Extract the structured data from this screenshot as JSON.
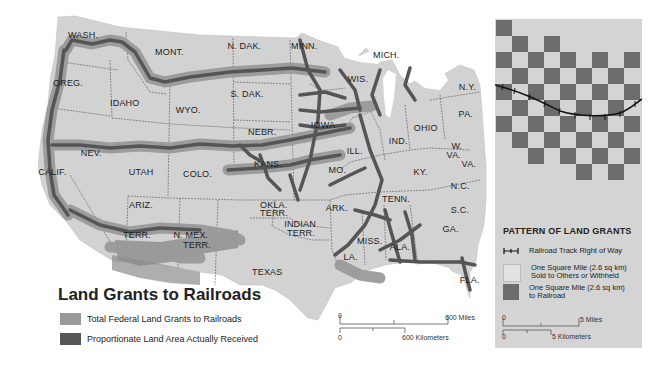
{
  "map": {
    "title": "Land Grants to Railroads",
    "colors": {
      "land": "#d2d2d2",
      "total_grant": "#9a9a9a",
      "received": "#5a5a5a",
      "border": "#555555",
      "water": "#ffffff"
    },
    "legend": [
      {
        "label": "Total Federal Land Grants to Railroads",
        "color": "#9a9a9a"
      },
      {
        "label": "Proportionate Land Area Actually Received",
        "color": "#555555"
      }
    ],
    "state_labels": [
      {
        "text": "WASH.",
        "x": 82,
        "y": 36
      },
      {
        "text": "MONT.",
        "x": 169,
        "y": 53
      },
      {
        "text": "N. DAK.",
        "x": 247,
        "y": 47
      },
      {
        "text": "MINN.",
        "x": 305,
        "y": 47
      },
      {
        "text": "MICH.",
        "x": 387,
        "y": 56
      },
      {
        "text": "OREG.",
        "x": 67,
        "y": 84
      },
      {
        "text": "IDAHO",
        "x": 124,
        "y": 104
      },
      {
        "text": "WYO.",
        "x": 187,
        "y": 111
      },
      {
        "text": "S. DAK.",
        "x": 250,
        "y": 95
      },
      {
        "text": "WIS.",
        "x": 359,
        "y": 80
      },
      {
        "text": "N.Y.",
        "x": 470,
        "y": 88
      },
      {
        "text": "PA.",
        "x": 467,
        "y": 115
      },
      {
        "text": "IOWA",
        "x": 322,
        "y": 126
      },
      {
        "text": "NEBR.",
        "x": 262,
        "y": 133
      },
      {
        "text": "OHIO",
        "x": 425,
        "y": 129
      },
      {
        "text": "NEV.",
        "x": 92,
        "y": 154
      },
      {
        "text": "IND.",
        "x": 400,
        "y": 142
      },
      {
        "text": "ILL.",
        "x": 358,
        "y": 152
      },
      {
        "text": "W.",
        "x": 457,
        "y": 147
      },
      {
        "text": "VA.",
        "x": 455,
        "y": 156
      },
      {
        "text": "UTAH",
        "x": 140,
        "y": 173
      },
      {
        "text": "COLO.",
        "x": 197,
        "y": 175
      },
      {
        "text": "KANS.",
        "x": 268,
        "y": 165
      },
      {
        "text": "MO.",
        "x": 337,
        "y": 171
      },
      {
        "text": "KY.",
        "x": 422,
        "y": 173
      },
      {
        "text": "VA.",
        "x": 470,
        "y": 165
      },
      {
        "text": "CALIF.",
        "x": 55,
        "y": 173
      },
      {
        "text": "N.C.",
        "x": 462,
        "y": 187
      },
      {
        "text": "ARIZ.",
        "x": 143,
        "y": 206
      },
      {
        "text": "TENN.",
        "x": 396,
        "y": 200
      },
      {
        "text": "OKLA.",
        "x": 274,
        "y": 206
      },
      {
        "text": "TERR.",
        "x": 274,
        "y": 214
      },
      {
        "text": "ARK.",
        "x": 337,
        "y": 209
      },
      {
        "text": "S.C.",
        "x": 462,
        "y": 211
      },
      {
        "text": "INDIAN",
        "x": 301,
        "y": 225
      },
      {
        "text": "TERR.",
        "x": 301,
        "y": 234
      },
      {
        "text": "TERR.",
        "x": 137,
        "y": 236
      },
      {
        "text": "N. MEX.",
        "x": 193,
        "y": 236
      },
      {
        "text": "TERR.",
        "x": 197,
        "y": 246
      },
      {
        "text": "GA.",
        "x": 451,
        "y": 230
      },
      {
        "text": "MISS.",
        "x": 371,
        "y": 242
      },
      {
        "text": "ALA.",
        "x": 401,
        "y": 248
      },
      {
        "text": "LA.",
        "x": 352,
        "y": 258
      },
      {
        "text": "TEXAS",
        "x": 266,
        "y": 273
      },
      {
        "text": "FLA.",
        "x": 471,
        "y": 281
      }
    ],
    "scale": {
      "miles_zero": "0",
      "miles_label": "600 Miles",
      "km_zero": "0",
      "km_label": "600 Kilometers"
    }
  },
  "panel": {
    "title": "PATTERN OF LAND GRANTS",
    "colors": {
      "light": "#d4d4d4",
      "dark": "#6c6c6c"
    },
    "grid": {
      "cols": 9,
      "rows": 10,
      "dark_cells": [
        [
          0
        ],
        [
          1,
          3
        ],
        [
          0,
          2,
          4,
          6,
          8
        ],
        [
          1,
          3,
          5,
          7
        ],
        [
          0,
          2,
          4,
          6,
          8
        ],
        [
          1,
          3,
          5,
          7
        ],
        [
          0,
          2,
          4,
          6,
          8
        ],
        [
          1,
          3,
          5,
          7
        ],
        [
          2,
          4,
          6,
          8
        ],
        [
          5,
          7
        ]
      ]
    },
    "legend": [
      {
        "icon": "railroad-track-icon",
        "label": "Railroad Track Right of Way"
      },
      {
        "icon": "light-square",
        "label_line1": "One Square Mile (2.6 sq km)",
        "label_line2": "Sold to Others or Withheld"
      },
      {
        "icon": "dark-square",
        "label_line1": "One Square Mile (2.6 sq km)",
        "label_line2": "to Railroad"
      }
    ],
    "scale": {
      "miles_zero": "0",
      "miles_label": "5 Miles",
      "km_zero": "0",
      "km_label": "5 Kilometers"
    }
  }
}
